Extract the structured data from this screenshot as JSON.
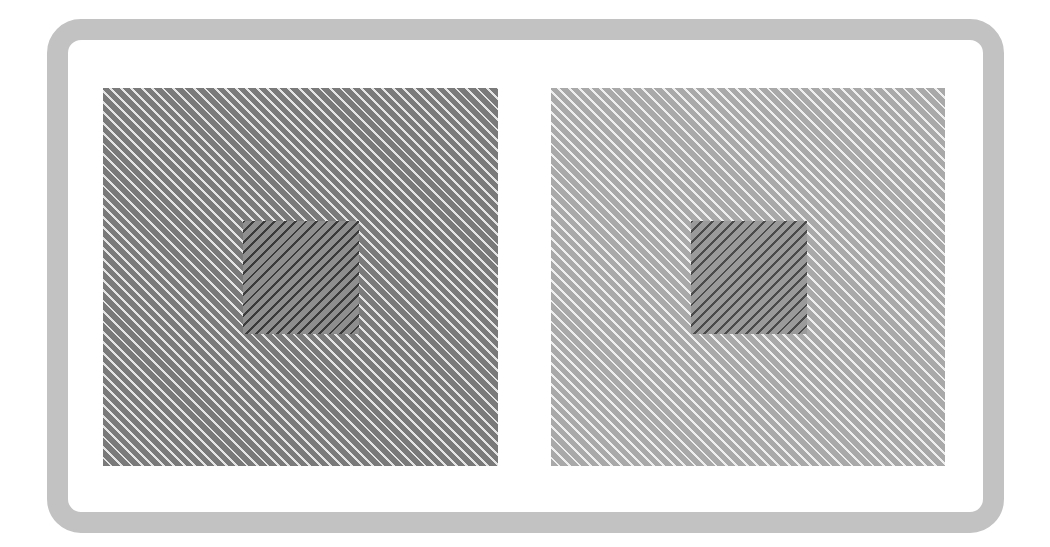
{
  "figure": {
    "frame": {
      "color": "#c2c2c2"
    },
    "panels": [
      {
        "id": "left",
        "background": "#7a7a7a",
        "stripe_color": "#e4e4e4",
        "stripe_direction": "down-right",
        "inner_square": {
          "background": "#8e8e8e",
          "stripe_color": "#3a3a3a",
          "stripe_direction": "up-right"
        }
      },
      {
        "id": "right",
        "background": "#a9a9a9",
        "stripe_color": "#eeeeee",
        "stripe_direction": "down-right",
        "inner_square": {
          "background": "#9a9a9a",
          "stripe_color": "#4a4a4a",
          "stripe_direction": "up-right"
        }
      }
    ]
  }
}
